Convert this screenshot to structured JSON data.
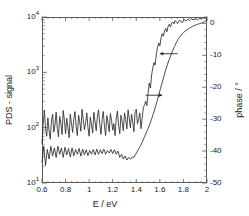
{
  "figure": {
    "background": "#ffffff",
    "frame_color": "#5a5a5a",
    "curve_color": "#2a2a2a"
  },
  "chart_data": {
    "type": "line",
    "title": "",
    "xlabel": "E / eV",
    "ylabel_left": "PDS - signal",
    "ylabel_right": "phase / °",
    "grid": false,
    "legend": "none",
    "xlim": [
      0.6,
      2.0
    ],
    "xticks": [
      0.6,
      0.8,
      1.0,
      1.2,
      1.4,
      1.6,
      1.8,
      2.0
    ],
    "xticklabels": [
      "0.6",
      "0.8",
      "1",
      "1.2",
      "1.4",
      "1.6",
      "1.8",
      "2"
    ],
    "y_left_scale": "log",
    "ylim_left": [
      10,
      10000
    ],
    "yticks_left": [
      10,
      100,
      1000,
      10000
    ],
    "yticklabels_left": [
      "10",
      "10",
      "10",
      "10"
    ],
    "yticklabel_exponents_left": [
      "1",
      "2",
      "3",
      "4"
    ],
    "y_right_scale": "linear",
    "ylim_right": [
      -50,
      2
    ],
    "yticks_right": [
      0,
      -10,
      -20,
      -30,
      -40,
      -50
    ],
    "yticklabels_right": [
      "0",
      "-10",
      "-20",
      "-30",
      "-40",
      "-50"
    ],
    "annotations": [
      {
        "name": "arrow-to-pds-curve",
        "text": "",
        "direction": "left",
        "x_tail": 1.75,
        "x_head": 1.6,
        "y_phase": -9.5
      },
      {
        "name": "arrow-to-phase-curve",
        "text": "",
        "direction": "right",
        "x_tail": 1.48,
        "x_head": 1.62,
        "y_phase": -22.5
      }
    ],
    "series": [
      {
        "name": "PDS - signal",
        "axis": "left",
        "style": "noisy",
        "x": [
          0.6,
          0.61,
          0.62,
          0.63,
          0.64,
          0.65,
          0.66,
          0.67,
          0.68,
          0.69,
          0.7,
          0.71,
          0.72,
          0.73,
          0.74,
          0.75,
          0.76,
          0.77,
          0.78,
          0.79,
          0.8,
          0.81,
          0.82,
          0.83,
          0.84,
          0.85,
          0.86,
          0.87,
          0.88,
          0.89,
          0.9,
          0.91,
          0.92,
          0.93,
          0.94,
          0.95,
          0.96,
          0.97,
          0.98,
          0.99,
          1.0,
          1.01,
          1.02,
          1.03,
          1.04,
          1.05,
          1.06,
          1.07,
          1.08,
          1.09,
          1.1,
          1.11,
          1.12,
          1.13,
          1.14,
          1.15,
          1.16,
          1.17,
          1.18,
          1.19,
          1.2,
          1.21,
          1.22,
          1.23,
          1.24,
          1.25,
          1.26,
          1.27,
          1.28,
          1.29,
          1.3,
          1.31,
          1.32,
          1.33,
          1.34,
          1.35,
          1.36,
          1.37,
          1.38,
          1.39,
          1.4,
          1.41,
          1.42,
          1.43,
          1.44,
          1.45,
          1.46,
          1.47,
          1.48,
          1.49,
          1.5,
          1.51,
          1.52,
          1.53,
          1.54,
          1.55,
          1.56,
          1.57,
          1.58,
          1.59,
          1.6,
          1.61,
          1.62,
          1.63,
          1.64,
          1.65,
          1.66,
          1.67,
          1.68,
          1.69,
          1.7,
          1.71,
          1.72,
          1.73,
          1.74,
          1.75,
          1.76,
          1.77,
          1.78,
          1.79,
          1.8,
          1.81,
          1.82,
          1.83,
          1.84,
          1.85,
          1.86,
          1.87,
          1.88,
          1.89,
          1.9,
          1.91,
          1.92,
          1.93,
          1.94,
          1.95,
          1.96,
          1.97,
          1.98,
          1.99,
          2.0
        ],
        "y": [
          52,
          118,
          205,
          96,
          70,
          150,
          88,
          62,
          132,
          175,
          83,
          112,
          190,
          97,
          68,
          160,
          118,
          75,
          205,
          135,
          78,
          148,
          100,
          66,
          175,
          120,
          82,
          145,
          195,
          104,
          72,
          168,
          128,
          86,
          215,
          140,
          92,
          120,
          185,
          100,
          70,
          155,
          112,
          80,
          190,
          130,
          88,
          160,
          210,
          118,
          76,
          140,
          196,
          106,
          72,
          165,
          124,
          84,
          180,
          136,
          90,
          118,
          72,
          150,
          200,
          110,
          78,
          168,
          128,
          88,
          185,
          140,
          95,
          210,
          150,
          100,
          175,
          125,
          85,
          195,
          215,
          118,
          140,
          185,
          96,
          150,
          230,
          260,
          300,
          250,
          420,
          640,
          520,
          900,
          1200,
          1500,
          1350,
          2100,
          2800,
          3400,
          3000,
          4200,
          5000,
          4500,
          5600,
          6200,
          5400,
          6800,
          7400,
          6600,
          7800,
          8200,
          7500,
          8600,
          8100,
          7600,
          8400,
          8800,
          8200,
          7900,
          8600,
          9000,
          8400,
          8800,
          9200,
          8600,
          9000,
          9400,
          8800,
          9200,
          9000,
          9400,
          8800,
          9200,
          9600,
          9000,
          9400,
          9800,
          9200,
          9600,
          10000
        ]
      },
      {
        "name": "phase",
        "axis": "right",
        "style": "smooth",
        "x": [
          0.6,
          0.615,
          0.63,
          0.645,
          0.66,
          0.675,
          0.69,
          0.705,
          0.72,
          0.735,
          0.75,
          0.765,
          0.78,
          0.795,
          0.81,
          0.825,
          0.84,
          0.855,
          0.87,
          0.885,
          0.9,
          0.915,
          0.93,
          0.945,
          0.96,
          0.975,
          0.99,
          1.005,
          1.02,
          1.035,
          1.05,
          1.065,
          1.08,
          1.095,
          1.11,
          1.125,
          1.14,
          1.155,
          1.17,
          1.185,
          1.2,
          1.215,
          1.23,
          1.245,
          1.26,
          1.275,
          1.29,
          1.305,
          1.32,
          1.335,
          1.35,
          1.365,
          1.38,
          1.395,
          1.41,
          1.425,
          1.44,
          1.455,
          1.47,
          1.485,
          1.5,
          1.515,
          1.53,
          1.545,
          1.56,
          1.575,
          1.59,
          1.605,
          1.62,
          1.635,
          1.65,
          1.665,
          1.68,
          1.695,
          1.71,
          1.725,
          1.74,
          1.755,
          1.77,
          1.785,
          1.8,
          1.815,
          1.83,
          1.845,
          1.86,
          1.875,
          1.89,
          1.905,
          1.92,
          1.935,
          1.95,
          1.965,
          1.98,
          1.995,
          2.0
        ],
        "y": [
          -43.5,
          -38.5,
          -44.5,
          -39.5,
          -42.5,
          -38.5,
          -41.5,
          -39.0,
          -42.0,
          -38.5,
          -41.0,
          -39.0,
          -42.0,
          -38.8,
          -41.2,
          -39.2,
          -41.8,
          -39.0,
          -41.5,
          -39.5,
          -41.0,
          -39.2,
          -41.6,
          -39.4,
          -41.2,
          -39.6,
          -41.4,
          -39.8,
          -41.0,
          -39.5,
          -41.2,
          -39.4,
          -41.0,
          -39.6,
          -40.8,
          -39.4,
          -41.0,
          -39.8,
          -40.6,
          -39.5,
          -40.8,
          -39.6,
          -41.0,
          -40.0,
          -42.0,
          -41.0,
          -42.5,
          -41.5,
          -42.8,
          -42.0,
          -42.5,
          -41.8,
          -42.0,
          -41.0,
          -40.0,
          -39.0,
          -38.0,
          -36.8,
          -35.5,
          -34.2,
          -33.0,
          -31.5,
          -30.0,
          -28.2,
          -26.5,
          -24.5,
          -22.5,
          -20.5,
          -18.5,
          -16.5,
          -14.5,
          -12.8,
          -11.2,
          -9.8,
          -8.4,
          -7.2,
          -6.0,
          -5.0,
          -4.2,
          -3.5,
          -2.9,
          -2.4,
          -2.0,
          -1.6,
          -1.3,
          -1.0,
          -0.7,
          -0.5,
          -0.3,
          -0.1,
          0.1,
          0.3,
          0.6,
          0.9,
          1.2
        ]
      }
    ]
  }
}
